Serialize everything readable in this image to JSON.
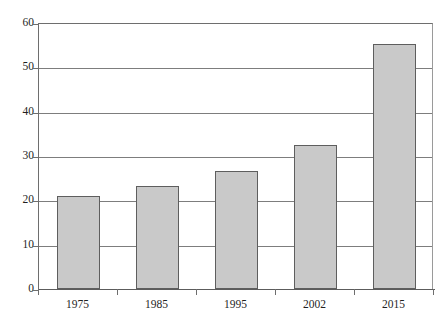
{
  "chart_data": {
    "type": "bar",
    "title": "",
    "subtitle": "",
    "xlabel": "",
    "ylabel": "",
    "categories": [
      "1975",
      "1985",
      "1995",
      "2002",
      "2015"
    ],
    "values": [
      21.0,
      23.2,
      26.6,
      32.5,
      55.3
    ],
    "series": [
      {
        "name": "",
        "values": [
          21.0,
          23.2,
          26.6,
          32.5,
          55.3
        ]
      }
    ],
    "ylim": [
      0,
      60
    ],
    "yticks": [
      0,
      10,
      20,
      30,
      40,
      50,
      60
    ],
    "ytick_labels": [
      "0",
      "10",
      "20",
      "30",
      "40",
      "50",
      "60"
    ],
    "xtick_labels": [
      "1975",
      "1985",
      "1995",
      "2002",
      "2015"
    ],
    "grid": {
      "horizontal": true,
      "vertical": false
    },
    "legend": {
      "visible": false,
      "position": "none",
      "entries": []
    },
    "annotations": [],
    "colors": {
      "bar_fill": "#c9c9c9",
      "bar_border": "#5e5e5e",
      "gridline": "#7d7d7d",
      "axis": "#6e6e6e",
      "text": "#1f1f1f",
      "background": "#ffffff"
    }
  }
}
